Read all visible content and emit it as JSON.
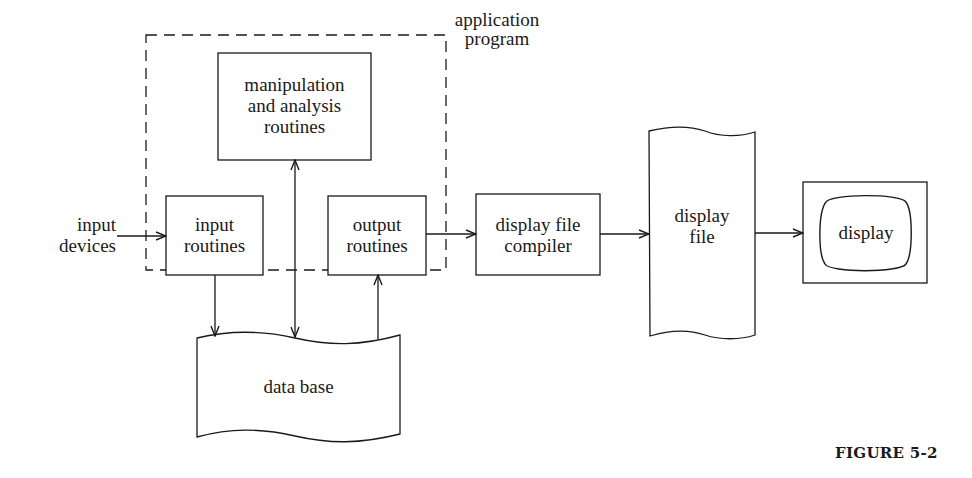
{
  "diagram": {
    "container": {
      "label_line1": "application",
      "label_line2": "program"
    },
    "nodes": {
      "input_devices": {
        "line1": "input",
        "line2": "devices"
      },
      "manipulation": {
        "line1": "manipulation",
        "line2": "and analysis",
        "line3": "routines"
      },
      "input_routines": {
        "line1": "input",
        "line2": "routines"
      },
      "output_routines": {
        "line1": "output",
        "line2": "routines"
      },
      "database": {
        "line1": "data base"
      },
      "compiler": {
        "line1": "display file",
        "line2": "compiler"
      },
      "display_file": {
        "line1": "display",
        "line2": "file"
      },
      "display": {
        "line1": "display"
      }
    },
    "edges": [
      {
        "from": "input devices",
        "to": "input routines",
        "type": "arrow"
      },
      {
        "from": "input routines",
        "to": "data base",
        "type": "arrow"
      },
      {
        "from": "manipulation and analysis routines",
        "to": "data base",
        "type": "bidirectional"
      },
      {
        "from": "data base",
        "to": "output routines",
        "type": "arrow"
      },
      {
        "from": "output routines",
        "to": "display file compiler",
        "type": "arrow"
      },
      {
        "from": "display file compiler",
        "to": "display file",
        "type": "arrow"
      },
      {
        "from": "display file",
        "to": "display",
        "type": "arrow"
      }
    ]
  },
  "caption": "FIGURE 5-2",
  "colors": {
    "ink": "#1a1a1a",
    "background": "#ffffff"
  }
}
